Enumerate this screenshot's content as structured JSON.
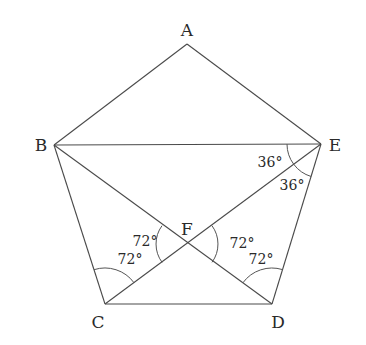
{
  "diagram": {
    "vertices": {
      "A": {
        "label": "A",
        "x": 187,
        "y": 44,
        "lx": 187,
        "ly": 36
      },
      "B": {
        "label": "B",
        "x": 54,
        "y": 145,
        "lx": 41,
        "ly": 151
      },
      "C": {
        "label": "C",
        "x": 105,
        "y": 304,
        "lx": 98,
        "ly": 328
      },
      "D": {
        "label": "D",
        "x": 272,
        "y": 304,
        "lx": 278,
        "ly": 328
      },
      "E": {
        "label": "E",
        "x": 321,
        "y": 144,
        "lx": 335,
        "ly": 151
      },
      "F": {
        "label": "F",
        "x": 187,
        "y": 244,
        "lx": 187,
        "ly": 235
      }
    },
    "segments": [
      {
        "name": "AB",
        "from": "A",
        "to": "B"
      },
      {
        "name": "AE",
        "from": "A",
        "to": "E"
      },
      {
        "name": "BC",
        "from": "B",
        "to": "C"
      },
      {
        "name": "CD",
        "from": "C",
        "to": "D"
      },
      {
        "name": "DE",
        "from": "D",
        "to": "E"
      },
      {
        "name": "BE",
        "from": "B",
        "to": "E"
      },
      {
        "name": "BD",
        "from": "B",
        "to": "D"
      },
      {
        "name": "CE",
        "from": "C",
        "to": "E"
      }
    ],
    "angle_labels": [
      {
        "name": "angle-BEC",
        "text": "36°",
        "x": 270,
        "y": 167
      },
      {
        "name": "angle-CED",
        "text": "36°",
        "x": 292,
        "y": 190
      },
      {
        "name": "angle-BFC",
        "text": "72°",
        "x": 145,
        "y": 246
      },
      {
        "name": "angle-BCF",
        "text": "72°",
        "x": 130,
        "y": 264
      },
      {
        "name": "angle-EFD",
        "text": "72°",
        "x": 242,
        "y": 248
      },
      {
        "name": "angle-EDF",
        "text": "72°",
        "x": 261,
        "y": 264
      }
    ],
    "colors": {
      "line": "#4a4a4a",
      "text": "#2a2a2a",
      "background": "#ffffff"
    }
  }
}
